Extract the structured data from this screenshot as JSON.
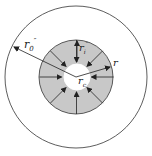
{
  "diagram": {
    "type": "concentric-circles-radial-flow",
    "colors": {
      "stroke": "#333333",
      "ring_fill": "#c8c8c8",
      "background": "#ffffff"
    },
    "labels": {
      "outer_radius": {
        "base": "r",
        "sub": "0",
        "sup": "″"
      },
      "inner_radius": {
        "base": "r",
        "sub": "i",
        "sup": "″"
      },
      "radius": {
        "base": "r"
      },
      "center_radius": {
        "base": "r",
        "sub": "c"
      }
    },
    "arrow_count": 8,
    "arrow_direction": "inward"
  }
}
